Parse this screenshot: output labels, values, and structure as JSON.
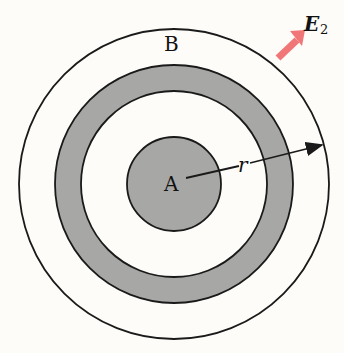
{
  "labels": {
    "inner_conductor": "A",
    "outer_region": "B",
    "radius": "r",
    "field_symbol": "E",
    "field_subscript": "2"
  },
  "colors": {
    "shaded": "#a7a7a5",
    "field_arrow": "#f07678",
    "line": "#1a1a1a",
    "background": "#fdfcf8"
  }
}
